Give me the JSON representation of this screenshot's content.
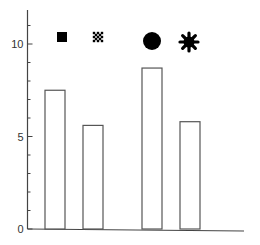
{
  "chart_data": {
    "type": "bar",
    "title": "",
    "xlabel": "",
    "ylabel": "",
    "categories": [
      "filled-square",
      "hatched-cross",
      "filled-circle",
      "asterisk"
    ],
    "category_markers": [
      "filled-square-icon",
      "hatched-cross-icon",
      "filled-circle-icon",
      "asterisk-icon"
    ],
    "values": [
      7.5,
      5.6,
      8.7,
      5.8
    ],
    "ylim": [
      0,
      12
    ],
    "yticks": [
      0,
      5,
      10
    ],
    "ytick_labels": [
      "0",
      "5",
      "10"
    ],
    "minor_ytick_step": 1,
    "grid": false,
    "legend": null,
    "bar_fill": "#ffffff",
    "bar_edge": "#555555",
    "marker_color": "#000000"
  }
}
